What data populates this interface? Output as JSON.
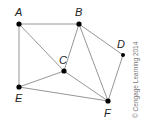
{
  "graph": {
    "nodes": [
      {
        "id": "A",
        "label": "A",
        "x": 19,
        "y": 24,
        "lx": 15,
        "ly": 16
      },
      {
        "id": "B",
        "label": "B",
        "x": 79,
        "y": 24,
        "lx": 75,
        "ly": 16
      },
      {
        "id": "C",
        "label": "C",
        "x": 64,
        "y": 71,
        "lx": 59,
        "ly": 64
      },
      {
        "id": "D",
        "label": "D",
        "x": 123,
        "y": 55,
        "lx": 117,
        "ly": 48
      },
      {
        "id": "E",
        "label": "E",
        "x": 19,
        "y": 87,
        "lx": 15,
        "ly": 102
      },
      {
        "id": "F",
        "label": "F",
        "x": 108,
        "y": 101,
        "lx": 104,
        "ly": 117
      }
    ],
    "edges": [
      [
        "A",
        "B"
      ],
      [
        "A",
        "E"
      ],
      [
        "A",
        "C"
      ],
      [
        "B",
        "C"
      ],
      [
        "B",
        "D"
      ],
      [
        "B",
        "F"
      ],
      [
        "C",
        "E"
      ],
      [
        "C",
        "F"
      ],
      [
        "E",
        "F"
      ],
      [
        "D",
        "F"
      ]
    ]
  },
  "copyright": "© Cengage Learning 2014"
}
